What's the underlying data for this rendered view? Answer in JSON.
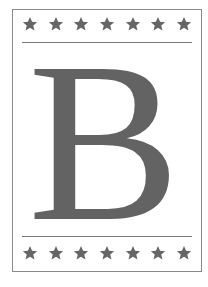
{
  "letter": "B",
  "colors": {
    "letter": "#636363",
    "stars": "#666666",
    "rules": "#7a7a7a",
    "border": "#8a8a8a",
    "background": "#ffffff"
  },
  "top_stars_count": 7,
  "bottom_stars_count": 7
}
